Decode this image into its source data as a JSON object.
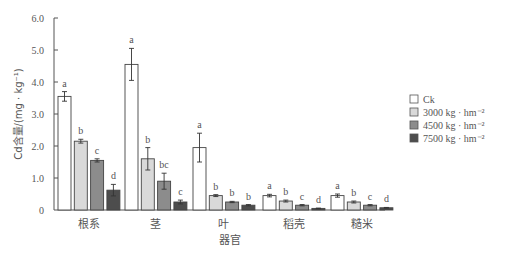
{
  "chart_data": {
    "type": "bar",
    "title": "",
    "xlabel": "器官",
    "ylabel": "Cd含量/(mg · kg⁻¹)",
    "ylim": [
      0,
      6.0
    ],
    "yticks": [
      "0",
      "1.0",
      "2.0",
      "3.0",
      "4.0",
      "5.0",
      "6.0"
    ],
    "grid": false,
    "legend_position": "right",
    "categories": [
      "根系",
      "茎",
      "叶",
      "稻壳",
      "糙米"
    ],
    "series": [
      {
        "name": "Ck",
        "color": "#ffffff",
        "values": [
          3.55,
          4.55,
          1.95,
          0.45,
          0.45
        ],
        "errors": [
          0.15,
          0.5,
          0.45,
          0.04,
          0.05
        ],
        "letters": [
          "a",
          "a",
          "a",
          "a",
          "a"
        ]
      },
      {
        "name": "3000 kg · hm⁻²",
        "color": "#d9d9d9",
        "values": [
          2.15,
          1.6,
          0.45,
          0.28,
          0.25
        ],
        "errors": [
          0.06,
          0.35,
          0.03,
          0.03,
          0.03
        ],
        "letters": [
          "b",
          "b",
          "b",
          "b",
          "b"
        ]
      },
      {
        "name": "4500 kg · hm⁻²",
        "color": "#8c8c8c",
        "values": [
          1.55,
          0.9,
          0.25,
          0.15,
          0.15
        ],
        "errors": [
          0.05,
          0.25,
          0.02,
          0.02,
          0.02
        ],
        "letters": [
          "c",
          "bc",
          "b",
          "c",
          "c"
        ]
      },
      {
        "name": "7500 kg · hm⁻²",
        "color": "#4d4d4d",
        "values": [
          0.62,
          0.25,
          0.15,
          0.05,
          0.07
        ],
        "errors": [
          0.18,
          0.06,
          0.02,
          0.01,
          0.01
        ],
        "letters": [
          "d",
          "c",
          "b",
          "d",
          "d"
        ]
      }
    ]
  }
}
